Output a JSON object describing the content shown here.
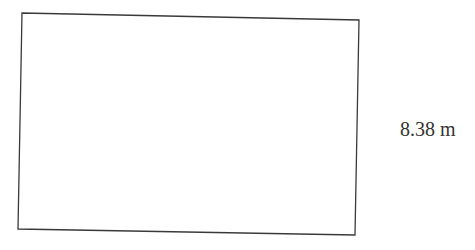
{
  "diagram": {
    "shape": "rectangle",
    "side_label": "8.38 m",
    "stroke_color": "#3a3a3a",
    "fill_color": "#ffffff"
  }
}
